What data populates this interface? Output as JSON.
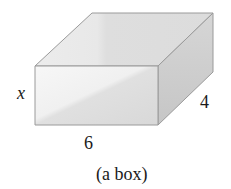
{
  "diagram": {
    "type": "3d-box",
    "labels": {
      "height": "x",
      "width": "6",
      "depth": "4"
    },
    "caption": "(a box)",
    "colors": {
      "top_face": "#e6e6e6",
      "front_face_light": "#f2f2f2",
      "front_face_dark": "#dcdcdc",
      "side_face": "#cfcfcf",
      "edges": "#9a9a9a"
    }
  }
}
